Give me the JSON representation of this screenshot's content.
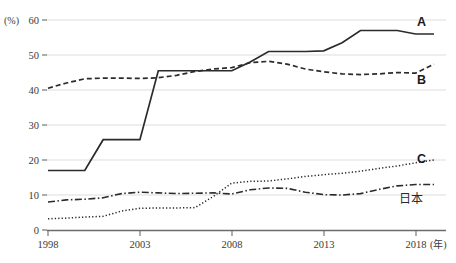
{
  "chart_data": {
    "type": "line",
    "title": "",
    "subtitle": "",
    "xlabel": "(年)",
    "ylabel": "(%)",
    "yunit_label": "(%)",
    "xunit_label": "(年)",
    "grid": true,
    "legend_position": "right-inline",
    "xlim": [
      1998,
      2019
    ],
    "ylim": [
      0,
      60
    ],
    "yticks": [
      0,
      10,
      20,
      30,
      40,
      50,
      60
    ],
    "ytick_labels": [
      "0",
      "10",
      "20",
      "30",
      "40",
      "50",
      "60"
    ],
    "xticks": [
      1998,
      2003,
      2008,
      2013,
      2018
    ],
    "xtick_labels": [
      "1998",
      "2003",
      "2008",
      "2013",
      "2018"
    ],
    "x": [
      1998,
      1999,
      2000,
      2001,
      2002,
      2003,
      2004,
      2005,
      2006,
      2007,
      2008,
      2009,
      2010,
      2011,
      2012,
      2013,
      2014,
      2015,
      2016,
      2017,
      2018,
      2019
    ],
    "series": [
      {
        "name": "A",
        "label": "A",
        "style": "solid",
        "color": "#2b2b2b",
        "values": [
          17.0,
          17.0,
          17.0,
          25.8,
          25.8,
          25.8,
          45.5,
          45.5,
          45.5,
          45.5,
          45.5,
          48.0,
          51.0,
          51.0,
          51.0,
          51.2,
          53.5,
          57.0,
          57.0,
          57.0,
          56.0,
          56.0
        ]
      },
      {
        "name": "B",
        "label": "B",
        "style": "dashed",
        "color": "#2b2b2b",
        "values": [
          40.5,
          42.0,
          43.2,
          43.4,
          43.4,
          43.3,
          43.5,
          44.2,
          45.3,
          46.0,
          46.4,
          47.8,
          48.2,
          47.4,
          46.0,
          45.2,
          44.6,
          44.4,
          44.6,
          45.0,
          44.8,
          47.4
        ]
      },
      {
        "name": "C",
        "label": "C",
        "style": "dotted",
        "color": "#2b2b2b",
        "values": [
          3.2,
          3.4,
          3.7,
          3.9,
          5.4,
          6.2,
          6.3,
          6.3,
          6.4,
          9.6,
          13.4,
          13.9,
          14.0,
          14.6,
          15.3,
          15.8,
          16.2,
          16.8,
          17.6,
          18.3,
          19.2,
          20.0
        ]
      },
      {
        "name": "日本",
        "label": "日本",
        "style": "dashdot",
        "color": "#2b2b2b",
        "values": [
          8.0,
          8.6,
          8.8,
          9.2,
          10.4,
          10.8,
          10.6,
          10.4,
          10.5,
          10.6,
          10.3,
          11.5,
          12.0,
          11.9,
          10.8,
          10.1,
          10.0,
          10.4,
          11.6,
          12.6,
          13.0,
          13.0
        ]
      }
    ]
  },
  "labels": {
    "series_a": "A",
    "series_b": "B",
    "series_c": "C",
    "series_japan": "日本",
    "y_unit": "(%)",
    "x_unit": "(年)",
    "y_60": "60",
    "y_50": "50",
    "y_40": "40",
    "y_30": "30",
    "y_20": "20",
    "y_10": "10",
    "y_0": "0",
    "x_1998": "1998",
    "x_2003": "2003",
    "x_2008": "2008",
    "x_2013": "2013",
    "x_2018": "2018"
  }
}
